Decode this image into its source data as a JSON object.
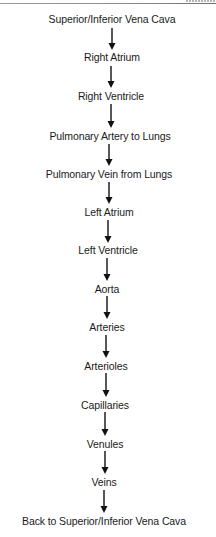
{
  "diagram": {
    "type": "vertical-flowchart",
    "title": "",
    "nodes": [
      {
        "label": "Superior/Inferior Vena Cava",
        "cx": 112,
        "cy": 19
      },
      {
        "label": "Right Atrium",
        "cx": 112,
        "cy": 57
      },
      {
        "label": "Right Ventricle",
        "cx": 111,
        "cy": 96
      },
      {
        "label": "Pulmonary Artery to Lungs",
        "cx": 110,
        "cy": 136
      },
      {
        "label": "Pulmonary Vein from Lungs",
        "cx": 109,
        "cy": 174
      },
      {
        "label": "Left Atrium",
        "cx": 109,
        "cy": 212
      },
      {
        "label": "Left Ventricle",
        "cx": 108,
        "cy": 250
      },
      {
        "label": "Aorta",
        "cx": 107,
        "cy": 289
      },
      {
        "label": "Arteries",
        "cx": 107,
        "cy": 327
      },
      {
        "label": "Arterioles",
        "cx": 106,
        "cy": 366
      },
      {
        "label": "Capillaries",
        "cx": 105,
        "cy": 405
      },
      {
        "label": "Venules",
        "cx": 105,
        "cy": 444
      },
      {
        "label": "Veins",
        "cx": 104,
        "cy": 482
      },
      {
        "label": "Back to Superior/Inferior Vena Cava",
        "cx": 104,
        "cy": 521
      }
    ],
    "edges": [
      {
        "from": 0,
        "to": 1,
        "x": 112,
        "y1": 28,
        "y2": 50
      },
      {
        "from": 1,
        "to": 2,
        "x": 111,
        "y1": 66,
        "y2": 88
      },
      {
        "from": 2,
        "to": 3,
        "x": 111,
        "y1": 104,
        "y2": 128
      },
      {
        "from": 3,
        "to": 4,
        "x": 109,
        "y1": 144,
        "y2": 166
      },
      {
        "from": 4,
        "to": 5,
        "x": 109,
        "y1": 182,
        "y2": 204
      },
      {
        "from": 5,
        "to": 6,
        "x": 108,
        "y1": 220,
        "y2": 243
      },
      {
        "from": 6,
        "to": 7,
        "x": 107,
        "y1": 258,
        "y2": 281
      },
      {
        "from": 7,
        "to": 8,
        "x": 107,
        "y1": 296,
        "y2": 319
      },
      {
        "from": 8,
        "to": 9,
        "x": 106,
        "y1": 335,
        "y2": 358
      },
      {
        "from": 9,
        "to": 10,
        "x": 106,
        "y1": 373,
        "y2": 397
      },
      {
        "from": 10,
        "to": 11,
        "x": 105,
        "y1": 412,
        "y2": 436
      },
      {
        "from": 11,
        "to": 12,
        "x": 105,
        "y1": 451,
        "y2": 474
      },
      {
        "from": 12,
        "to": 13,
        "x": 104,
        "y1": 490,
        "y2": 513
      }
    ],
    "colors": {
      "text": "#1a1a1a",
      "arrow": "#111111",
      "background": "#ffffff"
    }
  }
}
